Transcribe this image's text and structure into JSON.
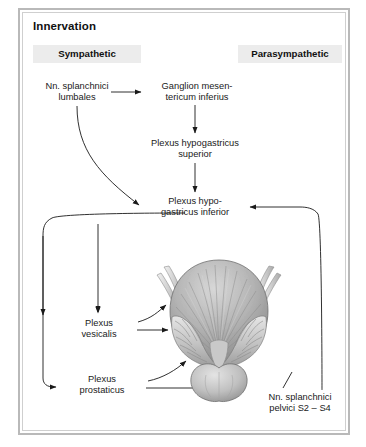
{
  "page": {
    "title": "Innervation",
    "border_color": "#b9b9b9",
    "badge_bg": "#ececec",
    "text_color": "#1a1a1a"
  },
  "columns": {
    "sympathetic": "Sympathetic",
    "parasympathetic": "Parasympathetic"
  },
  "nodes": {
    "splanchnici_lumbales": "Nn. splanchnici\nlumbales",
    "ganglion_mesentericum": "Ganglion mesen-\ntericum inferius",
    "plexus_hypogastricus_superior": "Plexus hypogastricus\nsuperior",
    "plexus_hypogastricus_inferior": "Plexus hypo-\ngastricus inferior",
    "plexus_vesicalis": "Plexus\nvesicalis",
    "plexus_prostaticus": "Plexus\nprostaticus",
    "splanchnici_pelvici": "Nn. splanchnici\npelvici S2 – S4"
  },
  "illustration": {
    "name": "urinary-bladder-seminal-vesicles-prostate",
    "parts": [
      "bladder",
      "seminal vesicle left",
      "seminal vesicle right",
      "ductus deferens left",
      "ductus deferens right",
      "prostate"
    ]
  },
  "connections": [
    {
      "from": "splanchnici_lumbales",
      "to": "ganglion_mesentericum",
      "style": "straight-arrow"
    },
    {
      "from": "ganglion_mesentericum",
      "to": "plexus_hypogastricus_superior",
      "style": "straight-arrow"
    },
    {
      "from": "plexus_hypogastricus_superior",
      "to": "plexus_hypogastricus_inferior",
      "style": "straight-arrow"
    },
    {
      "from": "splanchnici_lumbales",
      "to": "plexus_hypogastricus_inferior",
      "style": "curved-arrow"
    },
    {
      "from": "splanchnici_pelvici",
      "to": "plexus_hypogastricus_inferior",
      "style": "right-loop-arrow"
    },
    {
      "from": "plexus_hypogastricus_inferior",
      "to": "plexus_vesicalis",
      "style": "left-loop-arrow"
    },
    {
      "from": "plexus_hypogastricus_inferior",
      "to": "plexus_prostaticus",
      "style": "left-loop-arrow"
    },
    {
      "from": "plexus_vesicalis",
      "to": "bladder",
      "style": "straight-arrow"
    },
    {
      "from": "plexus_vesicalis",
      "to": "bladder-wall",
      "style": "curved-arrow"
    },
    {
      "from": "plexus_prostaticus",
      "to": "prostate",
      "style": "straight-arrow"
    },
    {
      "from": "plexus_prostaticus",
      "to": "seminal-vesicle",
      "style": "curved-arrow"
    }
  ]
}
